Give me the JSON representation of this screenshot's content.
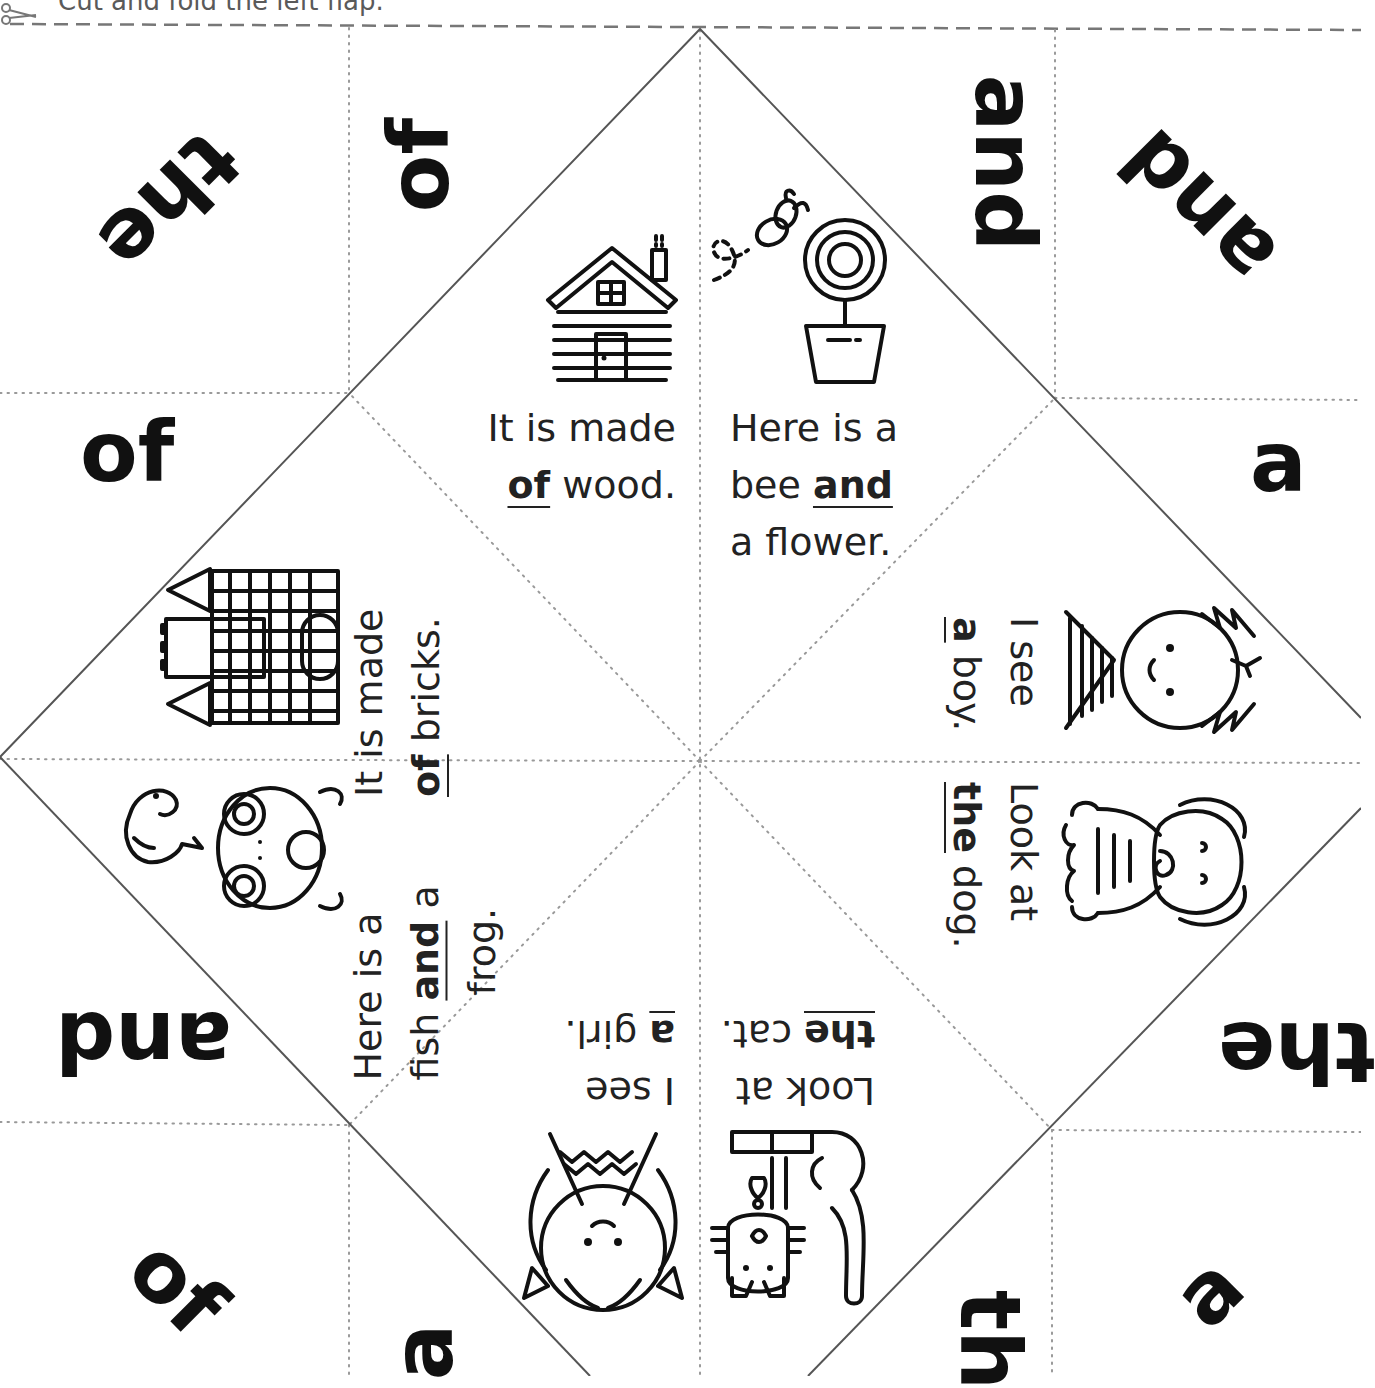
{
  "instruction": {
    "text": "Cut and fold the left flap.",
    "icon": "scissors-icon"
  },
  "corner_words": [
    {
      "id": "top-left-corner",
      "text": "the",
      "rotation": 135
    },
    {
      "id": "top-inner-left",
      "text": "of",
      "rotation": -90
    },
    {
      "id": "top-inner-right",
      "text": "and",
      "rotation": 90
    },
    {
      "id": "top-right-corner",
      "text": "and",
      "rotation": -135
    },
    {
      "id": "left-upper",
      "text": "of",
      "rotation": 0
    },
    {
      "id": "right-upper",
      "text": "a",
      "rotation": 0
    },
    {
      "id": "left-lower",
      "text": "and",
      "rotation": 180
    },
    {
      "id": "right-lower",
      "text": "the",
      "rotation": 180
    },
    {
      "id": "bottom-left-corner",
      "text": "of",
      "rotation": 45
    },
    {
      "id": "bottom-inner-left",
      "text": "a",
      "rotation": -90
    },
    {
      "id": "bottom-inner-right",
      "text": "th",
      "rotation": 90
    },
    {
      "id": "bottom-right-corner",
      "text": "a",
      "rotation": -45
    }
  ],
  "panels": [
    {
      "id": "house",
      "picture": "log-cabin-icon",
      "line1": "It is made",
      "sight_word": "of",
      "rest": "wood."
    },
    {
      "id": "flower",
      "picture": "bee-and-flower-icon",
      "line1": "Here is a",
      "line2_pre": "bee",
      "sight_word": "and",
      "line3": "a flower."
    },
    {
      "id": "castle",
      "picture": "castle-icon",
      "line1": "It is made",
      "sight_word": "of",
      "rest": "bricks."
    },
    {
      "id": "fish-frog",
      "picture": "fish-and-frog-icon",
      "line1": "Here is a",
      "line2_pre": "fish",
      "sight_word": "and",
      "line2_post": "a",
      "line3": "frog."
    },
    {
      "id": "boy",
      "picture": "boy-icon",
      "line1": "I see",
      "sight_word": "a",
      "rest": "boy."
    },
    {
      "id": "dog",
      "picture": "dog-icon",
      "line1": "Look at",
      "sight_word": "the",
      "rest": "dog."
    },
    {
      "id": "girl",
      "picture": "girl-icon",
      "line1": "I see",
      "sight_word": "a",
      "rest": "girl."
    },
    {
      "id": "cat",
      "picture": "cat-icon",
      "line1": "Look at",
      "sight_word": "the",
      "rest": "cat."
    }
  ],
  "colors": {
    "ink": "#111111",
    "fold_line": "#888888",
    "cut_line": "#777777",
    "diamond_line": "#555555"
  }
}
